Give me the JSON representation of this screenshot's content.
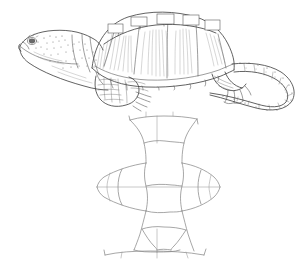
{
  "figure": {
    "kind": "scientific-line-illustration",
    "background_color": "#ffffff",
    "ink_color": "#5a5a5a",
    "plastron_line_color": "#8a8a8a",
    "width_px": 308,
    "height_px": 274,
    "panels": [
      {
        "id": "lateral-view",
        "label": "turtle-lateral-view",
        "bbox": [
          14,
          8,
          290,
          112
        ],
        "parts": [
          "head",
          "eye",
          "neck",
          "carapace",
          "vertebral-scutes",
          "costal-scutes",
          "marginal-scutes",
          "forelimb",
          "foreclaw",
          "hindlimb",
          "hindclaw",
          "tail",
          "tail-crest"
        ]
      },
      {
        "id": "plastron-view",
        "label": "plastron-ventral-diagram",
        "bbox": [
          96,
          114,
          222,
          262
        ],
        "parts": [
          "gular-scutes",
          "humeral-scutes",
          "pectoral-scutes",
          "abdominal-scutes",
          "femoral-scutes",
          "anal-scutes",
          "bridge-left",
          "bridge-right",
          "midline-seam"
        ]
      }
    ]
  },
  "plastron_geometry": {
    "midline_y": 187,
    "center_x": 157,
    "widest_left_x": 98,
    "widest_right_x": 218,
    "top_bar_y": 118,
    "bottom_bar_y": 252
  }
}
